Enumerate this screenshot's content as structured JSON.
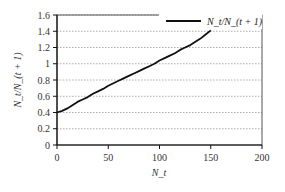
{
  "chart_data": {
    "type": "line",
    "title": "",
    "xlabel": "N_t",
    "ylabel": "N_t/N_(t + 1)",
    "xlim": [
      0,
      200
    ],
    "ylim": [
      0,
      1.6
    ],
    "x_ticks": [
      0,
      50,
      100,
      150,
      200
    ],
    "y_ticks": [
      0,
      0.2,
      0.4,
      0.6,
      0.8,
      1,
      1.2,
      1.4,
      1.6
    ],
    "y_tick_labels": [
      "0",
      "0.2",
      "0.4",
      "0.6",
      "0.8",
      "1",
      "1.2",
      "1.4",
      "1.6"
    ],
    "x_tick_labels": [
      "0",
      "50",
      "100",
      "150",
      "200"
    ],
    "grid": {
      "horizontal": true,
      "vertical": false,
      "style": "dotted"
    },
    "legend": {
      "position": "top-right",
      "entries": [
        "N_t/N_(t + 1)"
      ]
    },
    "series": [
      {
        "name": "N_t/N_(t + 1)",
        "color": "#111111",
        "x": [
          0,
          5,
          10,
          15,
          20,
          25,
          30,
          35,
          40,
          45,
          50,
          55,
          60,
          65,
          70,
          75,
          80,
          85,
          90,
          95,
          100,
          105,
          110,
          115,
          120,
          125,
          130,
          135,
          140,
          145,
          150
        ],
        "y": [
          0.4,
          0.42,
          0.45,
          0.49,
          0.53,
          0.56,
          0.59,
          0.63,
          0.66,
          0.69,
          0.73,
          0.76,
          0.79,
          0.82,
          0.85,
          0.88,
          0.91,
          0.94,
          0.97,
          1.0,
          1.04,
          1.07,
          1.1,
          1.13,
          1.17,
          1.2,
          1.23,
          1.27,
          1.31,
          1.36,
          1.41
        ]
      }
    ]
  }
}
